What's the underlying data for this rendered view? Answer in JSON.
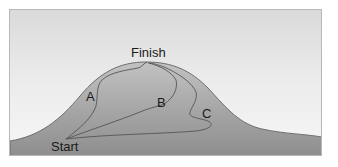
{
  "diagram": {
    "labels": {
      "finish": "Finish",
      "start": "Start",
      "path_a": "A",
      "path_b": "B",
      "path_c": "C"
    },
    "colors": {
      "sky_top": "#dadada",
      "sky_bottom": "#f6f6f6",
      "hill_fill_top": "#bdbdbd",
      "hill_fill_bottom": "#8e8e8e",
      "hill_outline": "#6e6e6e",
      "path_stroke": "#555555",
      "frame_border": "#b8b8b8"
    },
    "paths": [
      {
        "id": "A",
        "description": "leftmost path from Start up the left slope to Finish"
      },
      {
        "id": "B",
        "description": "middle path from Start through the center to Finish"
      },
      {
        "id": "C",
        "description": "rightmost winding path from Start around the right side to Finish"
      }
    ]
  }
}
